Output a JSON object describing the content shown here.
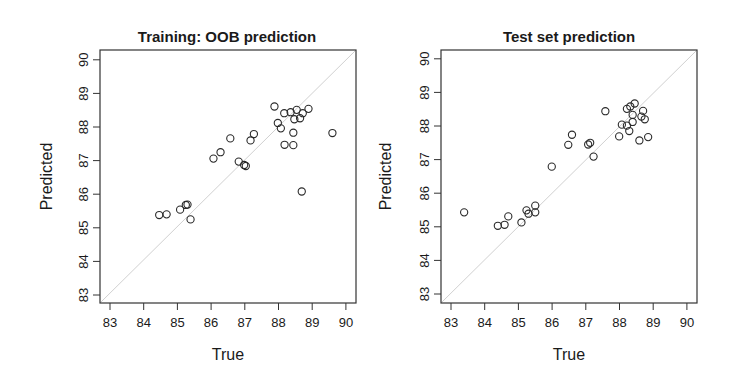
{
  "chart_data": [
    {
      "type": "scatter",
      "title": "Training: OOB prediction",
      "xlabel": "True",
      "ylabel": "Predicted",
      "xlim": [
        83,
        90
      ],
      "ylim": [
        83,
        90
      ],
      "xticks": [
        "83",
        "84",
        "85",
        "86",
        "87",
        "88",
        "89",
        "90"
      ],
      "yticks": [
        "83",
        "84",
        "85",
        "86",
        "87",
        "88",
        "89",
        "90"
      ],
      "grid": false,
      "reference_line": "y = x (light gray diagonal)",
      "marker": "open circle",
      "points": [
        {
          "x": 87.88,
          "y": 88.61
        },
        {
          "x": 88.17,
          "y": 88.41
        },
        {
          "x": 88.36,
          "y": 88.44
        },
        {
          "x": 88.54,
          "y": 88.51
        },
        {
          "x": 88.89,
          "y": 88.54
        },
        {
          "x": 88.72,
          "y": 88.41
        },
        {
          "x": 88.64,
          "y": 88.26
        },
        {
          "x": 88.47,
          "y": 88.23
        },
        {
          "x": 87.98,
          "y": 88.12
        },
        {
          "x": 88.07,
          "y": 87.96
        },
        {
          "x": 88.44,
          "y": 87.83
        },
        {
          "x": 89.6,
          "y": 87.82
        },
        {
          "x": 88.18,
          "y": 87.47
        },
        {
          "x": 88.44,
          "y": 87.46
        },
        {
          "x": 88.69,
          "y": 86.08
        },
        {
          "x": 86.57,
          "y": 87.66
        },
        {
          "x": 87.27,
          "y": 87.79
        },
        {
          "x": 87.17,
          "y": 87.6
        },
        {
          "x": 86.28,
          "y": 87.25
        },
        {
          "x": 86.07,
          "y": 87.06
        },
        {
          "x": 86.82,
          "y": 86.97
        },
        {
          "x": 86.98,
          "y": 86.87
        },
        {
          "x": 87.03,
          "y": 86.84
        },
        {
          "x": 84.46,
          "y": 85.38
        },
        {
          "x": 84.68,
          "y": 85.4
        },
        {
          "x": 85.08,
          "y": 85.54
        },
        {
          "x": 85.25,
          "y": 85.68
        },
        {
          "x": 85.3,
          "y": 85.69
        },
        {
          "x": 85.39,
          "y": 85.25
        }
      ]
    },
    {
      "type": "scatter",
      "title": "Test set prediction",
      "xlabel": "True",
      "ylabel": "Predicted",
      "xlim": [
        83,
        90
      ],
      "ylim": [
        83,
        90
      ],
      "xticks": [
        "83",
        "84",
        "85",
        "86",
        "87",
        "88",
        "89",
        "90"
      ],
      "yticks": [
        "83",
        "84",
        "85",
        "86",
        "87",
        "88",
        "89",
        "90"
      ],
      "grid": false,
      "reference_line": "y = x (light gray diagonal)",
      "marker": "open circle",
      "points": [
        {
          "x": 83.39,
          "y": 85.43
        },
        {
          "x": 84.39,
          "y": 85.03
        },
        {
          "x": 84.59,
          "y": 85.06
        },
        {
          "x": 84.7,
          "y": 85.31
        },
        {
          "x": 85.09,
          "y": 85.13
        },
        {
          "x": 85.24,
          "y": 85.49
        },
        {
          "x": 85.3,
          "y": 85.39
        },
        {
          "x": 85.5,
          "y": 85.63
        },
        {
          "x": 85.5,
          "y": 85.43
        },
        {
          "x": 85.99,
          "y": 86.79
        },
        {
          "x": 86.48,
          "y": 87.44
        },
        {
          "x": 86.59,
          "y": 87.74
        },
        {
          "x": 87.07,
          "y": 87.45
        },
        {
          "x": 87.13,
          "y": 87.5
        },
        {
          "x": 87.23,
          "y": 87.09
        },
        {
          "x": 87.58,
          "y": 88.44
        },
        {
          "x": 87.99,
          "y": 87.69
        },
        {
          "x": 88.07,
          "y": 88.04
        },
        {
          "x": 88.22,
          "y": 88.01
        },
        {
          "x": 88.22,
          "y": 88.51
        },
        {
          "x": 88.32,
          "y": 88.58
        },
        {
          "x": 88.45,
          "y": 88.67
        },
        {
          "x": 88.39,
          "y": 88.33
        },
        {
          "x": 88.39,
          "y": 88.12
        },
        {
          "x": 88.29,
          "y": 87.85
        },
        {
          "x": 88.65,
          "y": 88.28
        },
        {
          "x": 88.7,
          "y": 88.45
        },
        {
          "x": 88.75,
          "y": 88.2
        },
        {
          "x": 88.59,
          "y": 87.57
        },
        {
          "x": 88.85,
          "y": 87.67
        }
      ]
    }
  ],
  "style": {
    "axis_color": "#333333",
    "point_color": "#2a2a2a",
    "diagonal_color": "#d0d0d0",
    "text_color": "#1a1a1a"
  }
}
